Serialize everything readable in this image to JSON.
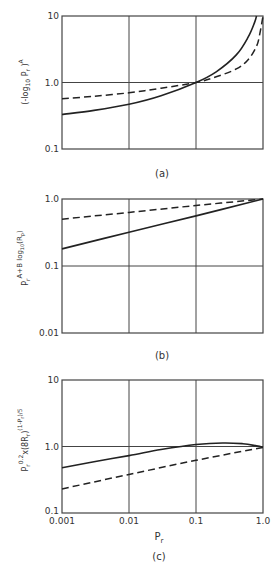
{
  "chart_data": [
    {
      "id": "a",
      "type": "line",
      "caption": "(a)",
      "title": "",
      "xlabel": "",
      "ylabel": "(-log10 Pr)^A",
      "xscale": "log",
      "yscale": "log",
      "xlim": [
        0.001,
        1.0
      ],
      "ylim": [
        0.1,
        10
      ],
      "y_ticks": [
        "10",
        "1.0",
        "0.1"
      ],
      "grid": true,
      "series": [
        {
          "name": "solid",
          "style": "solid",
          "x": [
            0.001,
            0.003,
            0.01,
            0.03,
            0.1,
            0.2,
            0.4,
            0.6,
            0.75,
            0.8
          ],
          "y": [
            0.33,
            0.38,
            0.47,
            0.63,
            1.0,
            1.45,
            2.6,
            4.8,
            8.0,
            10.0
          ]
        },
        {
          "name": "dashed",
          "style": "dashed",
          "x": [
            0.001,
            0.003,
            0.01,
            0.03,
            0.1,
            0.2,
            0.4,
            0.6,
            0.8,
            0.9,
            1.0
          ],
          "y": [
            0.57,
            0.62,
            0.7,
            0.82,
            1.0,
            1.22,
            1.6,
            2.2,
            3.5,
            5.5,
            10.0
          ]
        }
      ]
    },
    {
      "id": "b",
      "type": "line",
      "caption": "(b)",
      "title": "",
      "xlabel": "",
      "ylabel": "Pr^(A+B log10(Rp))",
      "xscale": "log",
      "yscale": "log",
      "xlim": [
        0.001,
        1.0
      ],
      "ylim": [
        0.01,
        1.0
      ],
      "y_ticks": [
        "1.0",
        "0.1",
        "0.01"
      ],
      "grid": true,
      "series": [
        {
          "name": "solid",
          "style": "solid",
          "x": [
            0.001,
            0.01,
            0.1,
            1.0
          ],
          "y": [
            0.18,
            0.32,
            0.56,
            1.0
          ]
        },
        {
          "name": "dashed",
          "style": "dashed",
          "x": [
            0.001,
            0.01,
            0.1,
            1.0
          ],
          "y": [
            0.5,
            0.63,
            0.8,
            1.0
          ]
        }
      ]
    },
    {
      "id": "c",
      "type": "line",
      "caption": "(c)",
      "title": "",
      "xlabel": "Pr",
      "ylabel": "Pr^0.2 x (8Rr)^((1-Pr)/5)",
      "xscale": "log",
      "yscale": "log",
      "xlim": [
        0.001,
        1.0
      ],
      "ylim": [
        0.1,
        10
      ],
      "x_ticks": [
        "0.001",
        "0.01",
        "0.1",
        "1.0"
      ],
      "y_ticks": [
        "10",
        "1.0",
        "0.1"
      ],
      "grid": true,
      "series": [
        {
          "name": "solid",
          "style": "solid",
          "x": [
            0.001,
            0.003,
            0.01,
            0.03,
            0.1,
            0.25,
            0.5,
            0.8,
            1.0
          ],
          "y": [
            0.48,
            0.59,
            0.73,
            0.9,
            1.07,
            1.13,
            1.1,
            1.02,
            0.97
          ]
        },
        {
          "name": "dashed",
          "style": "dashed",
          "x": [
            0.001,
            0.01,
            0.1,
            1.0
          ],
          "y": [
            0.23,
            0.38,
            0.62,
            0.97
          ]
        }
      ]
    }
  ],
  "labels": {
    "a": {
      "caption": "(a)",
      "ylabel_main": "(-log",
      "ylabel_sub": "10",
      "ylabel_mid": " P",
      "ylabel_sub2": "r",
      "ylabel_end": " )",
      "ylabel_sup": "A",
      "ticks": [
        "10",
        "1.0",
        "0.1"
      ]
    },
    "b": {
      "caption": "(b)",
      "ylabel_main": "P",
      "ylabel_sub": "r",
      "ylabel_sup": "A+B log",
      "ylabel_sup_sub": "10",
      "ylabel_sup_end": "(R",
      "ylabel_sup_sub2": "p",
      "ylabel_sup_close": ")",
      "ticks": [
        "1.0",
        "0.1",
        "0.01"
      ]
    },
    "c": {
      "caption": "(c)",
      "ylabel_main": "P",
      "ylabel_sub": "r",
      "ylabel_sup": "0.2",
      "ylabel_mid": "x(8R",
      "ylabel_sub2": "r",
      "ylabel_mid_end": ")",
      "ylabel_sup2": "(1-P",
      "ylabel_sup2_sub": "r",
      "ylabel_sup2_end": ")/5",
      "ticks": [
        "10",
        "1.0",
        "0.1"
      ],
      "xticks": [
        "0.001",
        "0.01",
        "0.1",
        "1.0"
      ],
      "xlabel_main": "P",
      "xlabel_sub": "r"
    }
  }
}
